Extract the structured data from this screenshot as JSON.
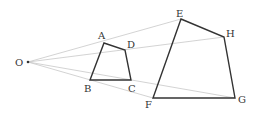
{
  "diagram": {
    "center": {
      "label": "O"
    },
    "small_quad": {
      "labels": [
        "A",
        "D",
        "C",
        "B"
      ]
    },
    "large_quad": {
      "labels": [
        "E",
        "H",
        "G",
        "F"
      ]
    },
    "correspondence": [
      {
        "from": "A",
        "to": "E"
      },
      {
        "from": "D",
        "to": "H"
      },
      {
        "from": "C",
        "to": "G"
      },
      {
        "from": "B",
        "to": "F"
      }
    ],
    "colors": {
      "edges": "#333333",
      "rays": "#c8c8c8",
      "labels": "#333333"
    }
  }
}
